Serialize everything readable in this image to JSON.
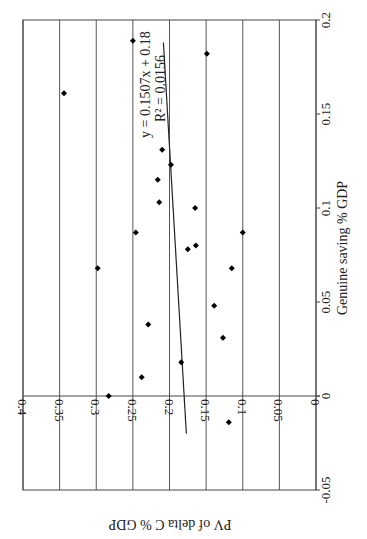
{
  "chart_data": {
    "type": "scatter",
    "orientation": "rotated 90 degrees clockwise",
    "title": "",
    "xlabel": "Genuine saving % GDP",
    "ylabel": "PV of delta C % GDP",
    "xlim": [
      -0.05,
      0.2
    ],
    "ylim": [
      0,
      0.4
    ],
    "xticks": [
      "-0.05",
      "0",
      "0.05",
      "0.1",
      "0.15",
      "0.2"
    ],
    "yticks": [
      "0",
      "0.05",
      "0.1",
      "0.15",
      "0.2",
      "0.25",
      "0.3",
      "0.35",
      "0.4"
    ],
    "grid": "y-major",
    "points": [
      {
        "x": 0.189,
        "y": 0.25
      },
      {
        "x": 0.182,
        "y": 0.149
      },
      {
        "x": 0.161,
        "y": 0.344
      },
      {
        "x": 0.131,
        "y": 0.21
      },
      {
        "x": 0.123,
        "y": 0.198
      },
      {
        "x": 0.115,
        "y": 0.216
      },
      {
        "x": 0.103,
        "y": 0.214
      },
      {
        "x": 0.1,
        "y": 0.165
      },
      {
        "x": 0.087,
        "y": 0.246
      },
      {
        "x": 0.087,
        "y": 0.1
      },
      {
        "x": 0.08,
        "y": 0.164
      },
      {
        "x": 0.078,
        "y": 0.175
      },
      {
        "x": 0.068,
        "y": 0.298
      },
      {
        "x": 0.068,
        "y": 0.115
      },
      {
        "x": 0.048,
        "y": 0.139
      },
      {
        "x": 0.038,
        "y": 0.229
      },
      {
        "x": 0.031,
        "y": 0.127
      },
      {
        "x": 0.018,
        "y": 0.184
      },
      {
        "x": 0.01,
        "y": 0.238
      },
      {
        "x": 0.0,
        "y": 0.283
      },
      {
        "x": -0.014,
        "y": 0.119
      }
    ],
    "trendline": {
      "type": "linear",
      "slope": 0.1507,
      "intercept": 0.18,
      "x_range": [
        -0.02,
        0.188
      ],
      "equation_label": "y = 0.1507x + 0.18",
      "r2_label": "R² = 0.0156"
    }
  }
}
